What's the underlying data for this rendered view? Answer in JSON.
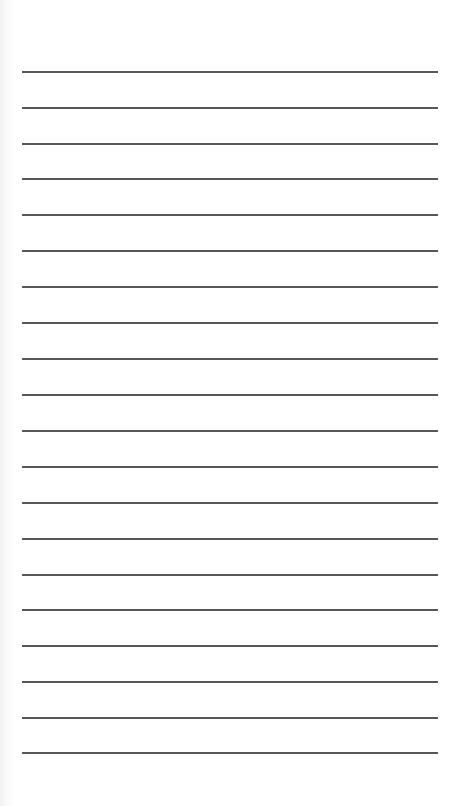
{
  "page": {
    "type": "lined-paper",
    "background_color": "#ffffff",
    "line_color": "#4a4a4a",
    "line_left": 22,
    "line_right": 438,
    "line_count": 20,
    "line_positions_y": [
      71,
      107,
      143,
      178,
      214,
      250,
      286,
      322,
      358,
      394,
      430,
      466,
      502,
      538,
      574,
      609,
      645,
      681,
      717,
      752
    ]
  }
}
